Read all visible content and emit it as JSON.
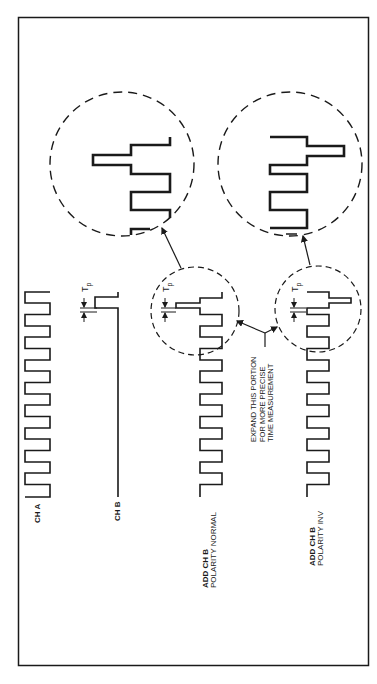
{
  "figure": {
    "frame": {
      "x": 18,
      "y": 17,
      "width": 351,
      "height": 649
    },
    "stroke_color": "#1a1a1a",
    "background": "#ffffff"
  },
  "traces": {
    "ch_a": {
      "label": "CH A"
    },
    "ch_b": {
      "label": "CH B"
    },
    "normal": {
      "label_line1": "ADD CH B",
      "label_line2": "POLARITY NORMAL"
    },
    "inv": {
      "label_line1": "ADD CH B",
      "label_line2": "POLARITY INV"
    }
  },
  "annotations": {
    "tp_symbol": "T",
    "tp_subscript": "p",
    "expand_note": {
      "line1": "EXPAND THIS PORTION",
      "line2": "FOR MORE PRECISE",
      "line3": "TIME MEASUREMENT"
    }
  },
  "magnifiers": [
    {
      "name": "normal-zoom",
      "cx": 122,
      "cy": 164,
      "r": 72
    },
    {
      "name": "inv-zoom",
      "cx": 290,
      "cy": 164,
      "r": 72
    }
  ],
  "small_circles": [
    {
      "name": "normal-region",
      "cx": 195,
      "cy": 311,
      "r": 42
    },
    {
      "name": "inv-region",
      "cx": 309,
      "cy": 307,
      "r": 42
    }
  ]
}
